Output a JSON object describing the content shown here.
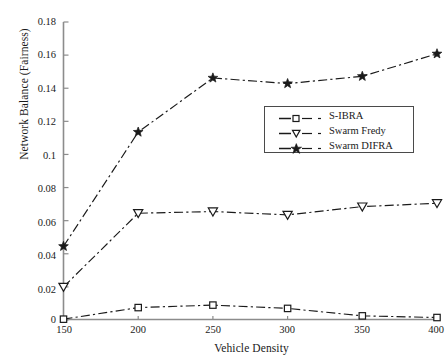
{
  "chart_data": {
    "type": "line",
    "title": "",
    "xlabel": "Vehicle Density",
    "ylabel": "Network Balance (Fairness)",
    "x": [
      150,
      200,
      250,
      300,
      350,
      400
    ],
    "xtick_labels": [
      "150",
      "200",
      "250",
      "300",
      "350",
      "400"
    ],
    "ytick_labels": [
      "0",
      "0.02",
      "0.04",
      "0.06",
      "0.08",
      "0.1",
      "0.12",
      "0.14",
      "0.16",
      "0.18"
    ],
    "ytick_values": [
      0,
      0.02,
      0.04,
      0.06,
      0.08,
      0.1,
      0.12,
      0.14,
      0.16,
      0.18
    ],
    "xlim": [
      150,
      400
    ],
    "ylim": [
      0,
      0.18
    ],
    "grid": false,
    "legend_position": "center-right",
    "series": [
      {
        "name": "S-IBRA",
        "marker": "square",
        "values": [
          0.0005,
          0.0075,
          0.009,
          0.007,
          0.0025,
          0.0015
        ]
      },
      {
        "name": "Swarm Fredy",
        "marker": "triangle-down",
        "values": [
          0.02,
          0.0645,
          0.0655,
          0.0635,
          0.0685,
          0.0705
        ]
      },
      {
        "name": "Swarm DIFRA",
        "marker": "star",
        "values": [
          0.0445,
          0.1135,
          0.1462,
          0.1428,
          0.1472,
          0.1608
        ]
      }
    ],
    "line_style": "dash-dot",
    "line_color": "#1a1a1a",
    "axis_color": "#7a7a7a",
    "background": "#ffffff"
  },
  "legend": {
    "entries": [
      {
        "label": "S-IBRA"
      },
      {
        "label": "Swarm Fredy"
      },
      {
        "label": "Swarm DIFRA"
      }
    ]
  }
}
